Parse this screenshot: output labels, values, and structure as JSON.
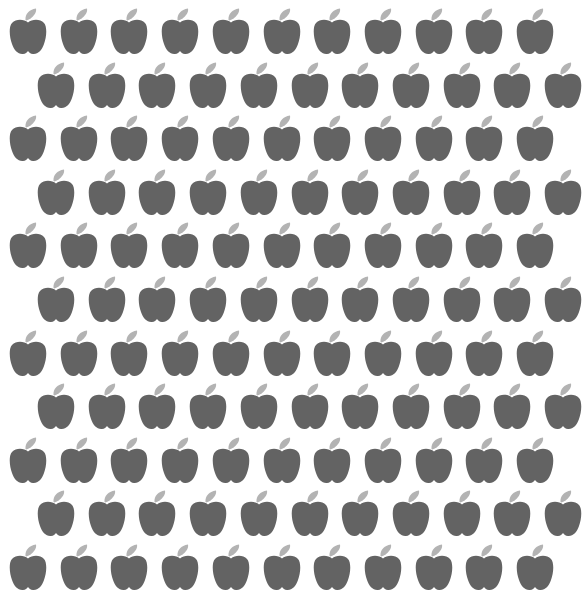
{
  "pattern": {
    "name": "apple-pattern",
    "background_color": "#ffffff",
    "apple_body_color": "#636363",
    "apple_leaf_color": "#b3b3b3",
    "rows": 11,
    "row_pitch": 53.6,
    "col_pitch": 50.7,
    "first_row_top": 7,
    "even_row_x_start": 9,
    "odd_row_x_start": 37,
    "apples_per_even_row": 11,
    "apples_per_odd_row": 11
  }
}
